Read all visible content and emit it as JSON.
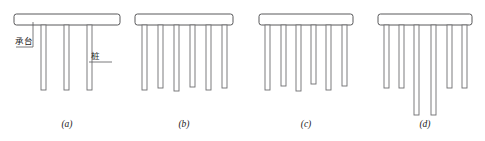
{
  "figure": {
    "background_color": "#ffffff",
    "cap_stroke_color": "#58585a",
    "pile_stroke_color": "#6e6e70",
    "fill_color": "#ffffff",
    "text_color": "#1b1b1b"
  },
  "labels": {
    "cap_label": "承台",
    "pile_label": "桩"
  },
  "captions": {
    "a": "(a)",
    "b": "(b)",
    "c": "(c)",
    "d": "(d)"
  },
  "groups": [
    {
      "id": "a",
      "caption": "(a)",
      "cap": {
        "x": 14,
        "y": 14,
        "width": 106,
        "height": 11,
        "rx": 2.5
      },
      "caption_x": 67,
      "caption_y": 127,
      "pile_count": 3,
      "piles": [
        {
          "x": 41,
          "width": 5.0,
          "top": 25,
          "bottom": 90
        },
        {
          "x": 64,
          "width": 5.0,
          "top": 25,
          "bottom": 90
        },
        {
          "x": 87,
          "width": 5.0,
          "top": 25,
          "bottom": 90
        }
      ]
    },
    {
      "id": "b",
      "caption": "(b)",
      "cap": {
        "x": 135,
        "y": 14,
        "width": 98,
        "height": 11,
        "rx": 2.5
      },
      "caption_x": 184,
      "caption_y": 127,
      "pile_count": 6,
      "piles": [
        {
          "x": 142,
          "width": 5.0,
          "top": 25,
          "bottom": 90
        },
        {
          "x": 158,
          "width": 5.0,
          "top": 25,
          "bottom": 88
        },
        {
          "x": 174,
          "width": 5.0,
          "top": 25,
          "bottom": 91
        },
        {
          "x": 190,
          "width": 5.0,
          "top": 25,
          "bottom": 87
        },
        {
          "x": 206,
          "width": 5.0,
          "top": 25,
          "bottom": 90
        },
        {
          "x": 222,
          "width": 5.0,
          "top": 25,
          "bottom": 88
        }
      ]
    },
    {
      "id": "c",
      "caption": "(c)",
      "cap": {
        "x": 259,
        "y": 14,
        "width": 94,
        "height": 11,
        "rx": 2.5
      },
      "caption_x": 306,
      "caption_y": 127,
      "pile_count": 6,
      "piles": [
        {
          "x": 265,
          "width": 5.0,
          "top": 25,
          "bottom": 90
        },
        {
          "x": 281,
          "width": 5.0,
          "top": 25,
          "bottom": 86
        },
        {
          "x": 296,
          "width": 5.0,
          "top": 25,
          "bottom": 91
        },
        {
          "x": 311,
          "width": 5.0,
          "top": 25,
          "bottom": 84
        },
        {
          "x": 326,
          "width": 5.0,
          "top": 25,
          "bottom": 90
        },
        {
          "x": 342,
          "width": 5.0,
          "top": 25,
          "bottom": 86
        }
      ]
    },
    {
      "id": "d",
      "caption": "(d)",
      "cap": {
        "x": 378,
        "y": 14,
        "width": 94,
        "height": 11,
        "rx": 2.5
      },
      "caption_x": 425,
      "caption_y": 127,
      "pile_count": 6,
      "piles": [
        {
          "x": 384,
          "width": 5.0,
          "top": 25,
          "bottom": 88
        },
        {
          "x": 399,
          "width": 5.0,
          "top": 25,
          "bottom": 88
        },
        {
          "x": 414,
          "width": 5.0,
          "top": 25,
          "bottom": 115
        },
        {
          "x": 431,
          "width": 5.0,
          "top": 25,
          "bottom": 115
        },
        {
          "x": 447,
          "width": 5.0,
          "top": 25,
          "bottom": 88
        },
        {
          "x": 462,
          "width": 5.0,
          "top": 25,
          "bottom": 88
        }
      ]
    }
  ],
  "annotations": {
    "cap_leader": {
      "path": "M 33 22 L 33 47 L 16 47",
      "text_x": 15,
      "text_y": 44
    },
    "pile_leader": {
      "path": "M 89 62 L 112 62",
      "text_x": 91,
      "text_y": 59
    }
  }
}
